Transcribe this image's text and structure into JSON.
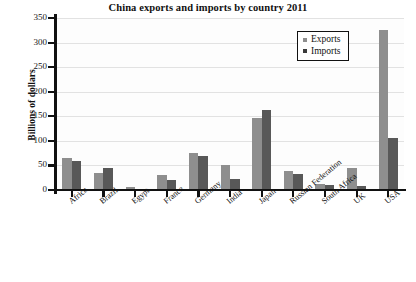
{
  "chart_data": {
    "type": "bar",
    "title": "China exports and imports by country 2011",
    "xlabel": "",
    "ylabel": "Billions of dollars",
    "ylim": [
      0,
      350
    ],
    "ytick_step": 50,
    "yticks": [
      "0",
      "50",
      "100",
      "150",
      "200",
      "250",
      "300",
      "350"
    ],
    "grid": true,
    "legend_position": "top-right",
    "categories": [
      "Africa",
      "Brazil",
      "Egypt",
      "France",
      "Germany",
      "India",
      "Japan",
      "Russian Federation",
      "South Africa",
      "UK",
      "USA"
    ],
    "series": [
      {
        "name": "Exports",
        "color": "#8e8e8e",
        "values": [
          65,
          34,
          7,
          30,
          75,
          50,
          147,
          38,
          13,
          44,
          325
        ]
      },
      {
        "name": "Imports",
        "color": "#585858",
        "values": [
          59,
          45,
          2,
          20,
          70,
          23,
          163,
          32,
          10,
          8,
          105
        ]
      }
    ]
  },
  "legend": {
    "items": [
      {
        "label": "Exports",
        "swatch": "exports-swatch"
      },
      {
        "label": "Imports",
        "swatch": "imports-swatch"
      }
    ]
  }
}
